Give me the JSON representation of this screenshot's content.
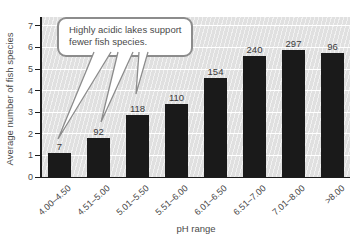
{
  "chart_data": {
    "type": "bar",
    "categories": [
      "4.00–4.50",
      "4.51–5.00",
      "5.01–5.50",
      "5.51–6.00",
      "6.01–6.50",
      "6.51–7.00",
      "7.01–8.00",
      ">8.00"
    ],
    "values": [
      1.1,
      1.8,
      2.85,
      3.4,
      4.6,
      5.6,
      5.9,
      5.75
    ],
    "bar_labels": [
      "7",
      "92",
      "118",
      "110",
      "154",
      "240",
      "297",
      "96"
    ],
    "xlabel": "pH range",
    "ylabel": "Average number of fish species",
    "ylim": [
      0,
      7
    ],
    "yticks": [
      0,
      1,
      2,
      3,
      4,
      5,
      6,
      7
    ],
    "grid": "horizontal-white",
    "legend": "none",
    "bar_color": "#1a1a1a"
  },
  "annotation": {
    "line1": "Highly acidic lakes support",
    "line2": "fewer fish species.",
    "points_to": [
      "7",
      "92",
      "118"
    ]
  },
  "colors": {
    "plot_background": "#e0e0e0",
    "gridline": "#ffffff",
    "axis": "#1c1c1c",
    "bar": "#1a1a1a",
    "callout_border": "#8c8c8c",
    "text": "#4a4a4a"
  }
}
